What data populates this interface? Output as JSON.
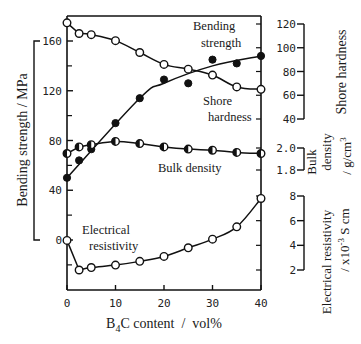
{
  "chart_data": {
    "type": "line",
    "title": "",
    "xlabel": "B4C content / vol%",
    "xlabel_parts": {
      "b": "B",
      "sub": "4",
      "rest": "C content  /  vol%"
    },
    "x_ticks": [
      0,
      10,
      20,
      30,
      40
    ],
    "xlim": [
      0,
      40
    ],
    "grid": false,
    "legend": "none (inline curve annotations)",
    "axes": {
      "left": {
        "label": "Bending strength  /  MPa",
        "ticks": [
          0,
          40,
          80,
          120,
          160
        ],
        "range": [
          0,
          160
        ]
      },
      "right_shore": {
        "label": "Shore hardness",
        "ticks": [
          40,
          60,
          80,
          100,
          120
        ],
        "range": [
          40,
          120
        ]
      },
      "right_density": {
        "label_line1": "Bulk",
        "label_line2": "density",
        "label_unit": "/  g/cm",
        "label_unit_sup": "3",
        "ticks": [
          "1.8",
          "2.0"
        ],
        "range": [
          1.8,
          2.0
        ]
      },
      "right_resistivity": {
        "label_line1": "Electrical resistivity",
        "label_unit": "/  x10",
        "label_unit_sup": "-3",
        "label_unit_tail": " S cm",
        "ticks": [
          2,
          4,
          6,
          8
        ],
        "range": [
          2,
          8
        ]
      }
    },
    "series": [
      {
        "name": "Bending strength",
        "axis": "left",
        "marker": "filled-circle",
        "x": [
          0,
          2.5,
          5,
          10,
          15,
          20,
          25,
          30,
          35,
          40
        ],
        "values": [
          50,
          64,
          73,
          94,
          114,
          129,
          126,
          145,
          142,
          148
        ]
      },
      {
        "name": "Shore hardness",
        "axis": "right_shore",
        "marker": "open-circle",
        "x": [
          0,
          2.5,
          5,
          10,
          15,
          20,
          25,
          30,
          35,
          40
        ],
        "values": [
          121,
          112,
          111,
          106,
          96,
          86,
          82,
          77,
          67,
          65
        ]
      },
      {
        "name": "Bulk density",
        "axis": "right_density",
        "marker": "half-filled-circle",
        "x": [
          0,
          2.5,
          5,
          10,
          15,
          20,
          25,
          30,
          35,
          40
        ],
        "values": [
          1.95,
          2.01,
          2.03,
          2.06,
          2.04,
          2.01,
          1.99,
          1.98,
          1.96,
          1.95
        ]
      },
      {
        "name": "Electrical resistivity",
        "axis": "right_resistivity",
        "marker": "open-circle",
        "x": [
          0,
          2.5,
          5,
          10,
          15,
          20,
          25,
          30,
          35,
          40
        ],
        "values": [
          4.4,
          2.0,
          2.2,
          2.4,
          2.7,
          3.1,
          3.8,
          4.5,
          5.5,
          7.8
        ]
      }
    ],
    "annotations": {
      "bending_line1": "Bending",
      "bending_line2": "strength",
      "shore_line1": "Shore",
      "shore_line2": "hardness",
      "density": "Bulk density",
      "resistivity_line1": "Electrical",
      "resistivity_line2": "resistivity"
    }
  }
}
